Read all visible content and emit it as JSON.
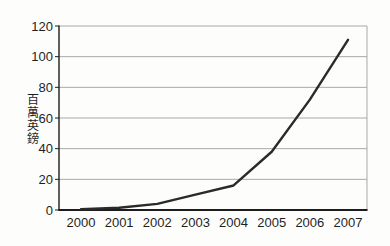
{
  "chart_data": {
    "type": "line",
    "x": [
      "2000",
      "2001",
      "2002",
      "2003",
      "2004",
      "2005",
      "2006",
      "2007"
    ],
    "values": [
      0.5,
      1.5,
      4,
      10,
      16,
      38,
      72,
      111
    ],
    "series_name": "value",
    "title": "",
    "xlabel": "",
    "ylabel": "百萬英鎊",
    "yticks": [
      0,
      20,
      40,
      60,
      80,
      100,
      120
    ],
    "ylim": [
      0,
      120
    ],
    "grid": true,
    "legend": false,
    "colors": {
      "line": "#2a2a2a",
      "grid": "#a9a9a9",
      "axis": "#1c1c1c",
      "text": "#1f1f1f",
      "background": "#fdfdfc"
    }
  }
}
